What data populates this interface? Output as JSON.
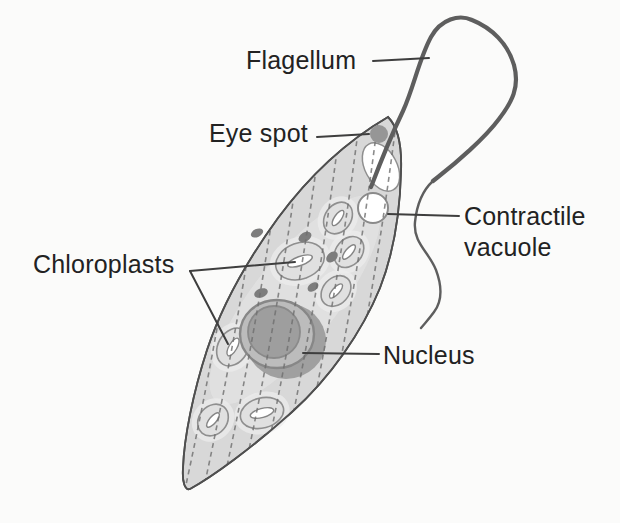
{
  "labels": {
    "flagellum": "Flagellum",
    "eye_spot": "Eye spot",
    "contractile_vacuole": {
      "line1": "Contractile",
      "line2": "vacuole"
    },
    "chloroplasts": "Chloroplasts",
    "nucleus": "Nucleus"
  },
  "colors": {
    "background": "#fbfbfa",
    "label_text": "#222222",
    "leader_line": "#3e3e3e",
    "cell_fill": "#d8d8d8",
    "cell_outline": "#4f4f4f",
    "flagellum": "#5e5e5e",
    "stripe": "#6e6e6e",
    "chloroplast_fill": "#e0e0e0",
    "chloroplast_outline": "#8f8f8f",
    "pyrenoid_fill": "#ffffff",
    "nucleus_fill": "#bcbcbc",
    "nucleolus_fill": "#9e9e9e",
    "nucleus_shadow": "#a0a0a0",
    "granule": "#7d7d7d",
    "eye_spot_fill": "#969696",
    "vacuole_fill": "#ffffff"
  }
}
